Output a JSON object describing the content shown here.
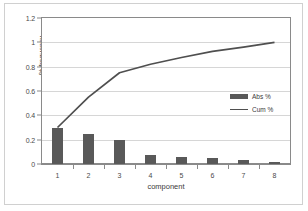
{
  "chart_data": {
    "type": "bar",
    "title": "Pareto chart",
    "xlabel": "component",
    "ylabel": "% frequency",
    "categories": [
      "1",
      "2",
      "3",
      "4",
      "5",
      "6",
      "7",
      "8"
    ],
    "ylim": [
      0,
      1.2
    ],
    "yticks": [
      "0",
      "0.2",
      "0.4",
      "0.6",
      "0.8",
      "1",
      "1.2"
    ],
    "ytick_values": [
      0,
      0.2,
      0.4,
      0.6,
      0.8,
      1,
      1.2
    ],
    "grid": true,
    "legend_position": "right-middle",
    "series": [
      {
        "name": "Abs %",
        "type": "bar",
        "color": "#595959",
        "values": [
          0.3,
          0.25,
          0.2,
          0.07,
          0.055,
          0.05,
          0.035,
          0.02
        ]
      },
      {
        "name": "Cum %",
        "type": "line",
        "color": "#4f4f4f",
        "values": [
          0.3,
          0.55,
          0.75,
          0.82,
          0.875,
          0.925,
          0.96,
          1.0
        ]
      }
    ]
  },
  "legend": {
    "entries": [
      {
        "label": "Abs %",
        "marker": "bar-swatch"
      },
      {
        "label": "Cum %",
        "marker": "line-swatch"
      }
    ]
  }
}
